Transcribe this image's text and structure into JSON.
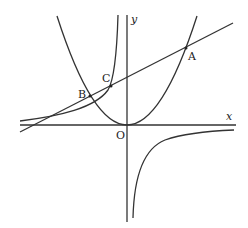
{
  "diagram": {
    "type": "coordinate-graph",
    "axes": {
      "x_label": "x",
      "y_label": "y",
      "origin_label": "O"
    },
    "points": [
      {
        "label": "A",
        "desc": "line ∩ parabola (right)"
      },
      {
        "label": "B",
        "desc": "line ∩ parabola (left)"
      },
      {
        "label": "C",
        "desc": "line ∩ hyperbola (left branch)"
      }
    ],
    "curves": [
      "parabola",
      "hyperbola",
      "line"
    ],
    "stroke_color": "#333333"
  }
}
